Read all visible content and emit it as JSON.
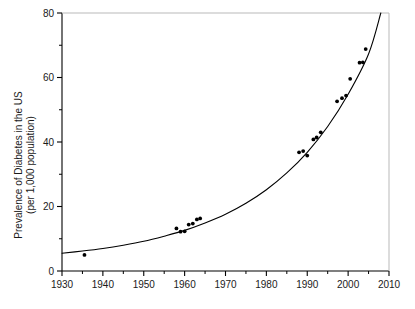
{
  "chart_data": {
    "type": "scatter",
    "title": "",
    "subtitle": "",
    "xlabel": "",
    "ylabel": "Prevalence of Diabetes in the US (per 1,000 population)",
    "ylabel_line1": "Prevalence of Diabetes in the US",
    "ylabel_line2": "(per 1,000 population)",
    "xlim": [
      1930,
      2010
    ],
    "ylim": [
      0,
      80
    ],
    "grid": false,
    "legend": "none",
    "x_major_ticks": [
      1930,
      1940,
      1950,
      1960,
      1970,
      1980,
      1990,
      2000,
      2010
    ],
    "x_minor_ticks": [
      1935,
      1945,
      1955,
      1965,
      1975,
      1985,
      1995,
      2005
    ],
    "y_major_ticks": [
      0,
      20,
      40,
      60,
      80
    ],
    "y_minor_ticks": [
      10,
      30,
      50,
      70
    ],
    "x_tick_labels": [
      "1930",
      "1940",
      "1950",
      "1960",
      "1970",
      "1980",
      "1990",
      "2000",
      "2010"
    ],
    "y_tick_labels": [
      "0",
      "20",
      "40",
      "60",
      "80"
    ],
    "series": [
      {
        "name": "Observed prevalence",
        "marker": "filled-circle",
        "color": "#000000",
        "points": [
          {
            "x": 1935.5,
            "y": 5.0
          },
          {
            "x": 1958.0,
            "y": 13.2
          },
          {
            "x": 1959.0,
            "y": 12.2
          },
          {
            "x": 1960.0,
            "y": 12.3
          },
          {
            "x": 1961.0,
            "y": 14.4
          },
          {
            "x": 1962.0,
            "y": 14.7
          },
          {
            "x": 1963.0,
            "y": 16.0
          },
          {
            "x": 1963.8,
            "y": 16.3
          },
          {
            "x": 1988.0,
            "y": 36.8
          },
          {
            "x": 1989.0,
            "y": 37.2
          },
          {
            "x": 1990.0,
            "y": 35.8
          },
          {
            "x": 1991.5,
            "y": 40.8
          },
          {
            "x": 1992.3,
            "y": 41.4
          },
          {
            "x": 1993.3,
            "y": 43.0
          },
          {
            "x": 1997.3,
            "y": 52.6
          },
          {
            "x": 1998.5,
            "y": 53.6
          },
          {
            "x": 1999.5,
            "y": 54.4
          },
          {
            "x": 2000.5,
            "y": 59.6
          },
          {
            "x": 2002.8,
            "y": 64.6
          },
          {
            "x": 2003.6,
            "y": 64.7
          },
          {
            "x": 2004.3,
            "y": 68.8
          }
        ]
      }
    ],
    "fit_curve": {
      "name": "Exponential trend",
      "color": "#000000",
      "type": "exponential",
      "description": "Smooth exponential fit rising from about 5.5 per 1,000 in 1930 to 80 per 1,000 near 2008",
      "points": [
        {
          "x": 1930,
          "y": 5.5
        },
        {
          "x": 1935,
          "y": 6.2
        },
        {
          "x": 1940,
          "y": 7.0
        },
        {
          "x": 1945,
          "y": 8.0
        },
        {
          "x": 1950,
          "y": 9.2
        },
        {
          "x": 1955,
          "y": 10.8
        },
        {
          "x": 1960,
          "y": 12.6
        },
        {
          "x": 1965,
          "y": 14.9
        },
        {
          "x": 1970,
          "y": 17.6
        },
        {
          "x": 1975,
          "y": 21.0
        },
        {
          "x": 1980,
          "y": 25.2
        },
        {
          "x": 1985,
          "y": 30.4
        },
        {
          "x": 1990,
          "y": 36.8
        },
        {
          "x": 1995,
          "y": 44.8
        },
        {
          "x": 2000,
          "y": 54.8
        },
        {
          "x": 2005,
          "y": 67.3
        },
        {
          "x": 2008,
          "y": 80.0
        }
      ]
    }
  }
}
